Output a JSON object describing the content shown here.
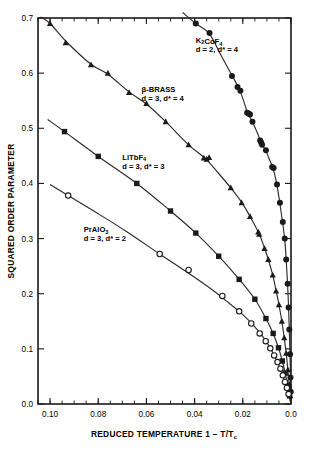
{
  "chart_data": {
    "type": "scatter",
    "title": "",
    "xlabel": "REDUCED TEMPERATURE 1 − T/T",
    "xlabel_sub": "c",
    "ylabel": "SQUARED ORDER PARAMETER",
    "xlim": [
      0.105,
      0.0
    ],
    "ylim": [
      0.0,
      0.7
    ],
    "x_reversed": true,
    "grid": false,
    "legend": "inline-annotations",
    "xticks": [
      0.1,
      0.08,
      0.06,
      0.04,
      0.02,
      0.0
    ],
    "xticklabels": [
      "0.10",
      "0.08",
      "0.06",
      "0.04",
      "0.02",
      "0.0"
    ],
    "x_minor_step": 0.005,
    "yticks": [
      0.0,
      0.1,
      0.2,
      0.3,
      0.4,
      0.5,
      0.6,
      0.7
    ],
    "yticklabels": [
      "0.0",
      "0.1",
      "0.2",
      "0.3",
      "0.4",
      "0.5",
      "0.6",
      "0.7"
    ],
    "series": [
      {
        "name": "K2CoF4",
        "label_line1": "K₂CoF₄",
        "label_line2": "d = 2, d* = 4",
        "marker": "filled-circle",
        "label_x": 0.0395,
        "label_y": 0.655,
        "points": [
          [
            0.0395,
            0.69
          ],
          [
            0.0338,
            0.673
          ],
          [
            0.0245,
            0.595
          ],
          [
            0.0222,
            0.575
          ],
          [
            0.021,
            0.568
          ],
          [
            0.0182,
            0.528
          ],
          [
            0.0176,
            0.527
          ],
          [
            0.017,
            0.525
          ],
          [
            0.016,
            0.512
          ],
          [
            0.0128,
            0.478
          ],
          [
            0.0124,
            0.474
          ],
          [
            0.012,
            0.47
          ],
          [
            0.0104,
            0.46
          ],
          [
            0.0078,
            0.43
          ],
          [
            0.0072,
            0.428
          ],
          [
            0.0058,
            0.398
          ],
          [
            0.0046,
            0.365
          ],
          [
            0.0034,
            0.33
          ],
          [
            0.0026,
            0.3
          ],
          [
            0.002,
            0.262
          ],
          [
            0.0014,
            0.218
          ],
          [
            0.001,
            0.175
          ],
          [
            0.0007,
            0.135
          ],
          [
            0.0004,
            0.09
          ],
          [
            0.0002,
            0.048
          ],
          [
            0.0001,
            0.022
          ]
        ],
        "curve": [
          [
            0.045,
            0.71
          ],
          [
            0.0395,
            0.69
          ],
          [
            0.034,
            0.672
          ],
          [
            0.029,
            0.632
          ],
          [
            0.0245,
            0.596
          ],
          [
            0.021,
            0.566
          ],
          [
            0.018,
            0.528
          ],
          [
            0.016,
            0.512
          ],
          [
            0.014,
            0.492
          ],
          [
            0.012,
            0.471
          ],
          [
            0.0104,
            0.459
          ],
          [
            0.009,
            0.444
          ],
          [
            0.0076,
            0.429
          ],
          [
            0.0062,
            0.405
          ],
          [
            0.005,
            0.375
          ],
          [
            0.004,
            0.345
          ],
          [
            0.0032,
            0.32
          ],
          [
            0.0026,
            0.298
          ],
          [
            0.002,
            0.262
          ],
          [
            0.0015,
            0.224
          ],
          [
            0.0011,
            0.185
          ],
          [
            0.0008,
            0.148
          ],
          [
            0.0005,
            0.105
          ],
          [
            0.0003,
            0.068
          ],
          [
            0.0001,
            0.028
          ],
          [
            0.0,
            0.0
          ]
        ]
      },
      {
        "name": "beta-BRASS",
        "label_line1": "β-BRASS",
        "label_line2": "d = 3, d* = 4",
        "marker": "filled-triangle",
        "label_x": 0.062,
        "label_y": 0.566,
        "points": [
          [
            0.1,
            0.69
          ],
          [
            0.0935,
            0.655
          ],
          [
            0.083,
            0.615
          ],
          [
            0.076,
            0.6
          ],
          [
            0.0672,
            0.565
          ],
          [
            0.06,
            0.545
          ],
          [
            0.052,
            0.512
          ],
          [
            0.0425,
            0.47
          ],
          [
            0.0362,
            0.446
          ],
          [
            0.035,
            0.444
          ],
          [
            0.034,
            0.447
          ],
          [
            0.025,
            0.392
          ],
          [
            0.0205,
            0.365
          ],
          [
            0.017,
            0.34
          ],
          [
            0.0136,
            0.312
          ],
          [
            0.0132,
            0.308
          ],
          [
            0.011,
            0.282
          ],
          [
            0.0094,
            0.262
          ],
          [
            0.0076,
            0.234
          ],
          [
            0.0062,
            0.205
          ],
          [
            0.005,
            0.18
          ],
          [
            0.0038,
            0.15
          ],
          [
            0.0028,
            0.12
          ],
          [
            0.002,
            0.092
          ],
          [
            0.0013,
            0.062
          ],
          [
            0.0007,
            0.035
          ],
          [
            0.0003,
            0.015
          ]
        ],
        "curve": [
          [
            0.104,
            0.702
          ],
          [
            0.1,
            0.69
          ],
          [
            0.093,
            0.656
          ],
          [
            0.083,
            0.616
          ],
          [
            0.076,
            0.598
          ],
          [
            0.0672,
            0.566
          ],
          [
            0.06,
            0.544
          ],
          [
            0.052,
            0.512
          ],
          [
            0.0425,
            0.47
          ],
          [
            0.0355,
            0.445
          ],
          [
            0.03,
            0.418
          ],
          [
            0.025,
            0.392
          ],
          [
            0.0205,
            0.366
          ],
          [
            0.017,
            0.34
          ],
          [
            0.0134,
            0.31
          ],
          [
            0.011,
            0.283
          ],
          [
            0.0094,
            0.262
          ],
          [
            0.0076,
            0.234
          ],
          [
            0.0062,
            0.206
          ],
          [
            0.005,
            0.18
          ],
          [
            0.0038,
            0.15
          ],
          [
            0.0028,
            0.12
          ],
          [
            0.002,
            0.092
          ],
          [
            0.0013,
            0.062
          ],
          [
            0.0007,
            0.034
          ],
          [
            0.0003,
            0.014
          ],
          [
            0.0,
            0.0
          ]
        ]
      },
      {
        "name": "LiTbF4",
        "label_line1": "LiTbF₄",
        "label_line2": "d = 3, d* = 3",
        "marker": "filled-square",
        "label_x": 0.07,
        "label_y": 0.443,
        "points": [
          [
            0.094,
            0.494
          ],
          [
            0.08,
            0.449
          ],
          [
            0.064,
            0.4
          ],
          [
            0.05,
            0.35
          ],
          [
            0.0395,
            0.31
          ],
          [
            0.03,
            0.268
          ],
          [
            0.0215,
            0.226
          ],
          [
            0.015,
            0.19
          ],
          [
            0.0104,
            0.155
          ],
          [
            0.0074,
            0.128
          ],
          [
            0.0052,
            0.102
          ],
          [
            0.0036,
            0.078
          ],
          [
            0.0024,
            0.056
          ],
          [
            0.0014,
            0.034
          ],
          [
            0.0006,
            0.015
          ]
        ],
        "curve": [
          [
            0.101,
            0.516
          ],
          [
            0.094,
            0.494
          ],
          [
            0.08,
            0.449
          ],
          [
            0.064,
            0.4
          ],
          [
            0.05,
            0.35
          ],
          [
            0.0395,
            0.31
          ],
          [
            0.03,
            0.268
          ],
          [
            0.0215,
            0.226
          ],
          [
            0.015,
            0.19
          ],
          [
            0.0104,
            0.155
          ],
          [
            0.0074,
            0.128
          ],
          [
            0.0052,
            0.102
          ],
          [
            0.0036,
            0.078
          ],
          [
            0.0024,
            0.056
          ],
          [
            0.0014,
            0.034
          ],
          [
            0.0006,
            0.014
          ],
          [
            0.0,
            0.0
          ]
        ]
      },
      {
        "name": "PrAlO3",
        "label_line1": "PrAlO₃",
        "label_line2": "d = 3, d* = 2",
        "marker": "open-circle",
        "label_x": 0.086,
        "label_y": 0.312,
        "points": [
          [
            0.0925,
            0.378
          ],
          [
            0.0545,
            0.272
          ],
          [
            0.0425,
            0.243
          ],
          [
            0.0285,
            0.196
          ],
          [
            0.0215,
            0.168
          ],
          [
            0.0165,
            0.146
          ],
          [
            0.013,
            0.128
          ],
          [
            0.0105,
            0.114
          ],
          [
            0.0086,
            0.101
          ],
          [
            0.007,
            0.088
          ],
          [
            0.0056,
            0.076
          ],
          [
            0.0044,
            0.064
          ],
          [
            0.0034,
            0.052
          ],
          [
            0.0025,
            0.04
          ],
          [
            0.0017,
            0.029
          ],
          [
            0.001,
            0.018
          ]
        ],
        "curve": [
          [
            0.1,
            0.398
          ],
          [
            0.0925,
            0.378
          ],
          [
            0.08,
            0.345
          ],
          [
            0.068,
            0.312
          ],
          [
            0.0545,
            0.272
          ],
          [
            0.0425,
            0.237
          ],
          [
            0.033,
            0.208
          ],
          [
            0.026,
            0.184
          ],
          [
            0.02,
            0.162
          ],
          [
            0.0155,
            0.142
          ],
          [
            0.012,
            0.124
          ],
          [
            0.0095,
            0.108
          ],
          [
            0.0074,
            0.092
          ],
          [
            0.0056,
            0.076
          ],
          [
            0.0042,
            0.061
          ],
          [
            0.003,
            0.046
          ],
          [
            0.0019,
            0.031
          ],
          [
            0.001,
            0.017
          ],
          [
            0.0,
            0.0
          ]
        ]
      }
    ]
  }
}
